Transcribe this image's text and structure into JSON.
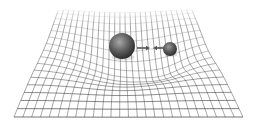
{
  "diagram": {
    "title": "Spacetime curvature with two masses",
    "caption": "",
    "grid": {
      "rows": 16,
      "cols": 26,
      "line_color": "#3a3a3a",
      "fade_color": "#ffffff",
      "near_edge": {
        "y": 117,
        "x_left": 14,
        "x_right": 243
      },
      "far_edge": {
        "y": 9,
        "x_left": 58,
        "x_right": 192
      }
    },
    "masses": [
      {
        "name": "large-mass",
        "cx": 122,
        "cy": 46,
        "r": 13,
        "well_depth": 22,
        "well_radius": 55
      },
      {
        "name": "small-mass",
        "cx": 170,
        "cy": 49,
        "r": 7,
        "well_depth": 10,
        "well_radius": 32
      }
    ],
    "arrows": [
      {
        "name": "attraction-arrow-right",
        "x1": 137,
        "x2": 150,
        "y": 48,
        "direction": "right"
      },
      {
        "name": "attraction-arrow-left",
        "x1": 164,
        "x2": 153,
        "y": 48,
        "direction": "left"
      }
    ],
    "colors": {
      "sphere_light": "#9a9a9a",
      "sphere_dark": "#2a2a2a",
      "arrow": "#555555"
    }
  }
}
